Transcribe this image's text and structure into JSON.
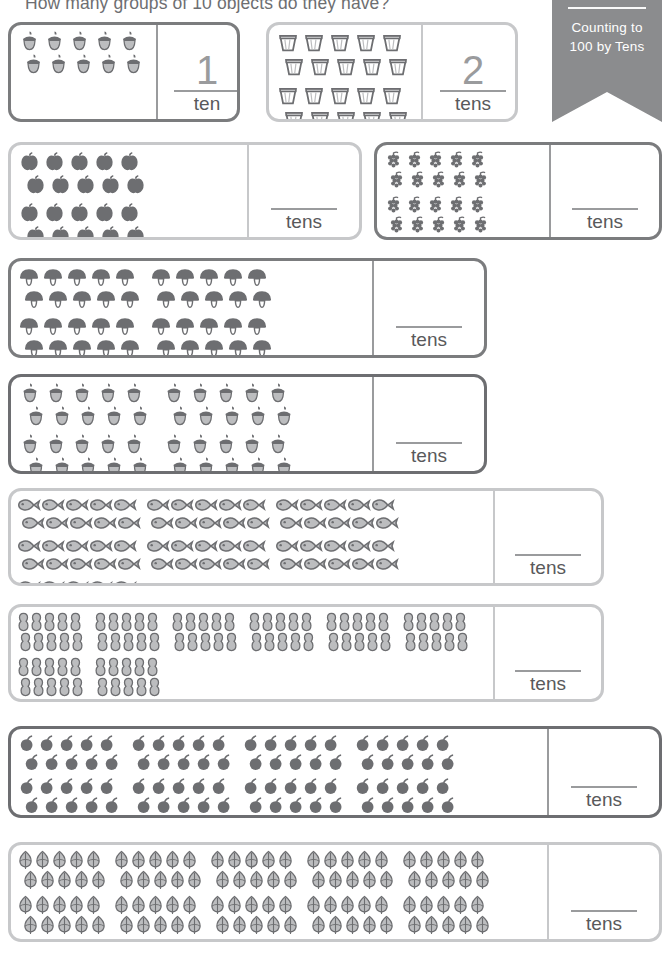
{
  "header": {
    "question": "How many groups of 10 objects do they have?"
  },
  "banner": {
    "line1": "Counting to",
    "line2": "100 by Tens",
    "background": "#8b8c8e",
    "text_color": "#ffffff"
  },
  "labels": {
    "ten": "ten",
    "tens": "tens"
  },
  "colors": {
    "border_dark": "#6d6e71",
    "border_mid": "#7b7c7e",
    "border_light": "#c7c8ca",
    "object_dark": "#6d6e71",
    "object_light": "#bcbdbf",
    "text": "#58595b"
  },
  "problems": [
    {
      "id": "p1",
      "icon": "acorn-icon",
      "groups": 1,
      "per_group": 10,
      "answer": "1",
      "answer_label": "ten",
      "filled": true,
      "border": "mid"
    },
    {
      "id": "p2",
      "icon": "bucket-icon",
      "groups": 2,
      "per_group": 10,
      "answer": "2",
      "answer_label": "tens",
      "filled": true,
      "border": "light"
    },
    {
      "id": "p3",
      "icon": "apple-icon",
      "groups": 3,
      "per_group": 10,
      "answer": "",
      "answer_label": "tens",
      "filled": false,
      "border": "light"
    },
    {
      "id": "p4",
      "icon": "grapes-icon",
      "groups": 4,
      "per_group": 10,
      "answer": "",
      "answer_label": "tens",
      "filled": false,
      "border": "mid"
    },
    {
      "id": "p5",
      "icon": "mushroom-icon",
      "groups": 5,
      "per_group": 10,
      "answer": "",
      "answer_label": "tens",
      "filled": false,
      "border": "mid"
    },
    {
      "id": "p6",
      "icon": "acorn-icon",
      "groups": 6,
      "per_group": 10,
      "answer": "",
      "answer_label": "tens",
      "filled": false,
      "border": "dark"
    },
    {
      "id": "p7",
      "icon": "fish-icon",
      "groups": 7,
      "per_group": 10,
      "answer": "",
      "answer_label": "tens",
      "filled": false,
      "border": "light"
    },
    {
      "id": "p8",
      "icon": "peanut-icon",
      "groups": 8,
      "per_group": 10,
      "answer": "",
      "answer_label": "tens",
      "filled": false,
      "border": "light"
    },
    {
      "id": "p9",
      "icon": "cherry-icon",
      "groups": 9,
      "per_group": 10,
      "answer": "",
      "answer_label": "tens",
      "filled": false,
      "border": "dark"
    },
    {
      "id": "p10",
      "icon": "leaf-icon",
      "groups": 10,
      "per_group": 10,
      "answer": "",
      "answer_label": "tens",
      "filled": false,
      "border": "light"
    }
  ]
}
